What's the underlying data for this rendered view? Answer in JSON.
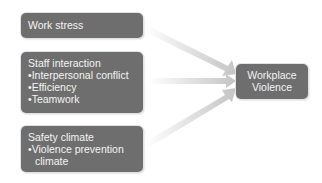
{
  "diagram": {
    "sources": [
      {
        "title": "Work stress",
        "items": []
      },
      {
        "title": "Staff interaction",
        "items": [
          "Interpersonal conflict",
          "Efficiency",
          "Teamwork"
        ]
      },
      {
        "title": "Safety climate",
        "items": [
          "Violence prevention",
          "climate"
        ]
      }
    ],
    "target": {
      "line1": "Workplace",
      "line2": "Violence"
    },
    "colors": {
      "box": "#6e6e6e",
      "text": "#f4f4f4",
      "arrow": "#c8c8c8"
    }
  }
}
